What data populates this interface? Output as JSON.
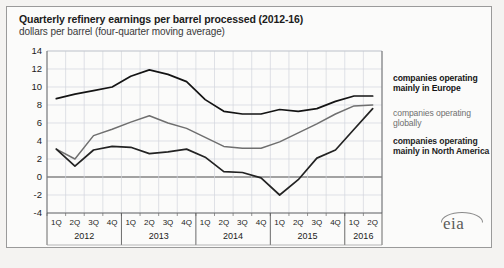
{
  "header": {
    "title": "Quarterly refinery earnings per barrel processed (2012-16)",
    "subtitle": "dollars per barrel (four-quarter moving average)"
  },
  "legend": {
    "items": [
      {
        "label": "companies operating mainly in Europe",
        "color": "#141414"
      },
      {
        "label": "companies operating globally",
        "color": "#6f6f6f"
      },
      {
        "label": "companies operating mainly in North America",
        "color": "#232323"
      }
    ]
  },
  "logo": {
    "text": "eia"
  },
  "axis": {
    "y_ticks": [
      "14",
      "12",
      "10",
      "8",
      "6",
      "4",
      "2",
      "0",
      "-2",
      "-4"
    ],
    "quarter_labels": [
      "1Q",
      "2Q",
      "3Q",
      "4Q",
      "1Q",
      "2Q",
      "3Q",
      "4Q",
      "1Q",
      "2Q",
      "3Q",
      "4Q",
      "1Q",
      "2Q",
      "3Q",
      "4Q",
      "1Q",
      "2Q"
    ],
    "year_labels": [
      "2012",
      "2013",
      "2014",
      "2015",
      "2016"
    ]
  },
  "chart_data": {
    "type": "line",
    "title": "Quarterly refinery earnings per barrel processed (2012-16)",
    "subtitle": "dollars per barrel (four-quarter moving average)",
    "xlabel": "",
    "ylabel": "dollars per barrel",
    "ylim": [
      -4,
      14
    ],
    "ytick_step": 2,
    "grid": true,
    "zero_line": true,
    "legend_position": "right",
    "x": [
      "2012 1Q",
      "2012 2Q",
      "2012 3Q",
      "2012 4Q",
      "2013 1Q",
      "2013 2Q",
      "2013 3Q",
      "2013 4Q",
      "2014 1Q",
      "2014 2Q",
      "2014 3Q",
      "2014 4Q",
      "2015 1Q",
      "2015 2Q",
      "2015 3Q",
      "2015 4Q",
      "2016 1Q",
      "2016 2Q"
    ],
    "series": [
      {
        "name": "companies operating mainly in Europe",
        "color": "#141414",
        "values": [
          8.7,
          9.2,
          9.6,
          10.0,
          11.2,
          11.9,
          11.4,
          10.6,
          8.6,
          7.3,
          7.0,
          7.0,
          7.5,
          7.3,
          7.6,
          8.4,
          9.0,
          9.0
        ]
      },
      {
        "name": "companies operating globally",
        "color": "#6f6f6f",
        "values": [
          3.1,
          2.0,
          4.6,
          5.3,
          6.1,
          6.8,
          6.0,
          5.4,
          4.4,
          3.4,
          3.2,
          3.2,
          3.9,
          4.9,
          5.9,
          7.0,
          7.9,
          8.0
        ]
      },
      {
        "name": "companies operating mainly in North America",
        "color": "#232323",
        "values": [
          3.1,
          1.2,
          3.0,
          3.4,
          3.3,
          2.6,
          2.8,
          3.1,
          2.2,
          0.6,
          0.5,
          -0.1,
          -2.0,
          -0.3,
          2.1,
          3.0,
          5.3,
          7.6
        ]
      }
    ],
    "convergence_note": "all three series converge near 7 at 2016 2Q"
  }
}
